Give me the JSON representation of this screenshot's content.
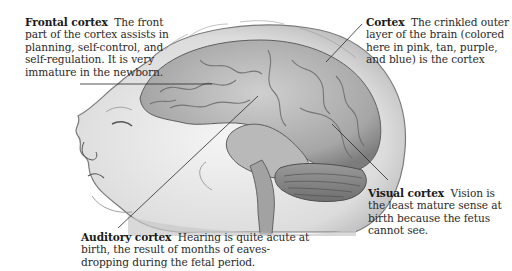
{
  "figure": {
    "palette": {
      "ink": "#2a2a2a",
      "shade_dark": "#6e6e6e",
      "shade_mid": "#a9a9a9",
      "shade_light": "#d9d9d9",
      "background": "#ffffff"
    }
  },
  "labels": {
    "frontal": {
      "term": "Frontal cortex",
      "text": "The front part of the cortex assists in planning, self-control, and self-regulation. It is very immature in the newborn."
    },
    "cortex": {
      "term": "Cortex",
      "text": "The crinkled outer layer of the brain (colored here in pink, tan, purple, and blue) is the cortex"
    },
    "visual": {
      "term": "Visual cortex",
      "text": "Vision is the least mature sense at birth because the fetus cannot see."
    },
    "auditory": {
      "term": "Auditory cortex",
      "text": "Hearing is quite acute at birth, the result of months of eaves-dropping during the fetal period."
    }
  }
}
